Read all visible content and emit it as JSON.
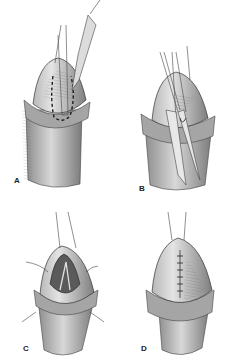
{
  "figure": {
    "type": "surgical-illustration",
    "panels": [
      {
        "id": "A",
        "label": "A",
        "content": "glans with dashed incision outline, forceps and scalpel"
      },
      {
        "id": "B",
        "label": "B",
        "content": "glans incision with forceps and sutures being placed"
      },
      {
        "id": "C",
        "label": "C",
        "content": "opened incision with stay sutures"
      },
      {
        "id": "D",
        "label": "D",
        "content": "closed incision with interrupted sutures"
      }
    ],
    "colors": {
      "skin_shade": "#9a9a9a",
      "skin_light": "#d6d6d6",
      "line": "#333333",
      "background": "#ffffff"
    }
  }
}
